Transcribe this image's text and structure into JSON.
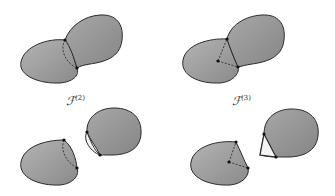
{
  "figure": {
    "panels": [
      {
        "id": "top-left",
        "label": ""
      },
      {
        "id": "top-right",
        "label": ""
      },
      {
        "id": "bottom-left",
        "label": ""
      },
      {
        "id": "bottom-right",
        "label": ""
      }
    ],
    "labels": {
      "f2": {
        "base": "ℱ",
        "sup": "(2)"
      },
      "f3": {
        "base": "ℱ",
        "sup": "(3)"
      }
    },
    "colors": {
      "fill": "#9a9a9a",
      "fill_light": "#c4c4c4",
      "stroke": "#2a2a2a",
      "hole": "#f4f4f4",
      "vertex": "#111111"
    }
  }
}
